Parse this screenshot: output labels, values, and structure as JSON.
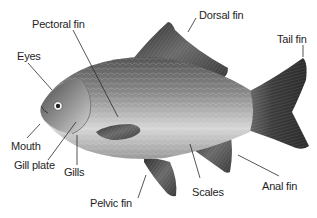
{
  "diagram": {
    "colors": {
      "background": "#ffffff",
      "label_text": "#1e1e1e",
      "leader_line": "#2a2a2a",
      "body_light": "#e8e8e8",
      "body_dark": "#5a5a5a",
      "fin_dark": "#3a3a3a"
    },
    "labels": [
      {
        "id": "pectoral-fin",
        "text": "Pectoral fin",
        "x": 32,
        "y": 18
      },
      {
        "id": "eyes",
        "text": "Eyes",
        "x": 17,
        "y": 50
      },
      {
        "id": "dorsal-fin",
        "text": "Dorsal fin",
        "x": 199,
        "y": 9
      },
      {
        "id": "tail-fin",
        "text": "Tail fin",
        "x": 277,
        "y": 33
      },
      {
        "id": "mouth",
        "text": "Mouth",
        "x": 11,
        "y": 140
      },
      {
        "id": "gill-plate",
        "text": "Gill plate",
        "x": 14,
        "y": 159
      },
      {
        "id": "gills",
        "text": "Gills",
        "x": 64,
        "y": 166
      },
      {
        "id": "pelvic-fin",
        "text": "Pelvic fin",
        "x": 90,
        "y": 197
      },
      {
        "id": "scales",
        "text": "Scales",
        "x": 192,
        "y": 186
      },
      {
        "id": "anal-fin",
        "text": "Anal fin",
        "x": 262,
        "y": 180
      }
    ]
  }
}
